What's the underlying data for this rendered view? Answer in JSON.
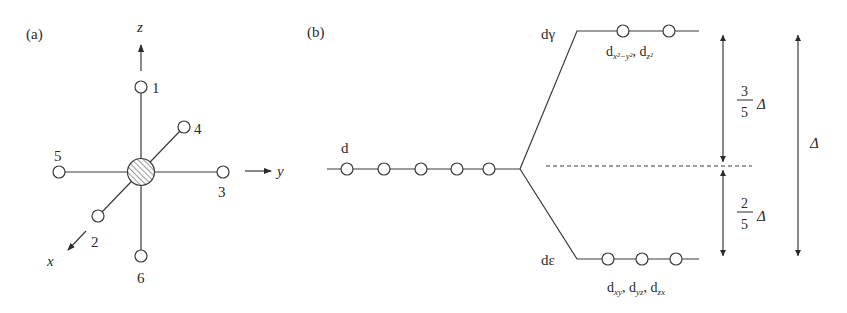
{
  "panel_a": {
    "label": "(a)",
    "axes": {
      "z": "z",
      "y": "y",
      "x": "x"
    },
    "ligands": [
      {
        "id": "1",
        "label": "1",
        "position": "+z"
      },
      {
        "id": "2",
        "label": "2",
        "position": "+x"
      },
      {
        "id": "3",
        "label": "3",
        "position": "+y"
      },
      {
        "id": "4",
        "label": "4",
        "position": "-x"
      },
      {
        "id": "5",
        "label": "5",
        "position": "-y"
      },
      {
        "id": "6",
        "label": "6",
        "position": "-z"
      }
    ],
    "center": "metal-ion-hatched"
  },
  "panel_b": {
    "label": "(b)",
    "degenerate_level": {
      "label": "d",
      "orbital_count": 5
    },
    "upper_level": {
      "label": "dγ",
      "orbital_count": 2,
      "orbitals_text": {
        "d1": "d",
        "sub1": "x²−y²",
        "sep": ", ",
        "d2": "d",
        "sub2": "z²"
      }
    },
    "lower_level": {
      "label": "dε",
      "orbital_count": 3,
      "orbitals_text": {
        "d1": "d",
        "sub1": "xy",
        "sep1": ", ",
        "d2": "d",
        "sub2": "yz",
        "sep2": ", ",
        "d3": "d",
        "sub3": "zx"
      }
    },
    "splitting": {
      "upper": {
        "numerator": "3",
        "denominator": "5",
        "symbol": "Δ"
      },
      "lower": {
        "numerator": "2",
        "denominator": "5",
        "symbol": "Δ"
      },
      "total": {
        "symbol": "Δ"
      }
    }
  }
}
